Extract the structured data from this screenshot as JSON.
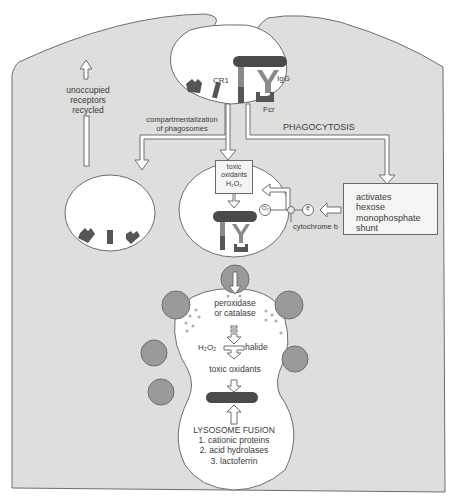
{
  "diagram": {
    "colors": {
      "cytoplasm": "#dededc",
      "outline": "#6e6e6e",
      "vacuole": "#ffffff",
      "receptor": "#555555",
      "bacterium": "#4a4a4a",
      "antibody": "#8a8a8a",
      "lysosome": "#9a9a9a",
      "granule": "#a8a8a8"
    },
    "labels": {
      "cr1": "CR1",
      "igg": "IgG",
      "fcr": "Fcr",
      "recycled": [
        "unoccupied",
        "receptors",
        "recycled"
      ],
      "compartment": [
        "compartmentalization",
        "of phagosomes"
      ],
      "phagocytosis": "PHAGOCYTOSIS",
      "toxic_box": [
        "toxic",
        "oxidants",
        "H₂O₂"
      ],
      "o2": "O₂",
      "e": "e",
      "cytochrome": "cytochrome b",
      "hmp": [
        "activates",
        "hexose",
        "monophosphate",
        "shunt"
      ],
      "peroxidase": [
        "peroxidase",
        "or catalase"
      ],
      "h2o2": "H₂O₂",
      "halide": "halide",
      "toxic_oxidants": "toxic oxidants",
      "fusion_title": "LYSOSOME FUSION",
      "fusion_items": [
        "1. cationic proteins",
        "2. acid hydrolases",
        "3. lactoferrin"
      ]
    }
  }
}
